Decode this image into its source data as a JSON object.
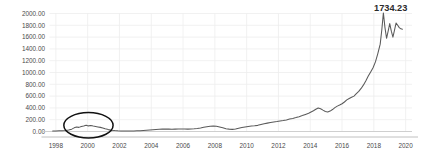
{
  "chart_data": {
    "type": "line",
    "title": "",
    "subtitle": "",
    "xlabel": "",
    "ylabel": "",
    "xlim": [
      1997.6,
      2020.4
    ],
    "ylim": [
      0,
      2000
    ],
    "grid": true,
    "legend": false,
    "legend_position": "none",
    "y_ticks": [
      0,
      200,
      400,
      600,
      800,
      1000,
      1200,
      1400,
      1600,
      1800,
      2000
    ],
    "y_tick_labels": [
      "0.00",
      "200.00",
      "400.00",
      "600.00",
      "800.00",
      "1000.00",
      "1200.00",
      "1400.00",
      "1600.00",
      "1800.00",
      "2000.00"
    ],
    "x_ticks": [
      1998,
      2000,
      2002,
      2004,
      2006,
      2008,
      2010,
      2012,
      2014,
      2016,
      2018,
      2020
    ],
    "x_tick_labels": [
      "1998",
      "2000",
      "2002",
      "2004",
      "2006",
      "2008",
      "2010",
      "2012",
      "2014",
      "2016",
      "2018",
      "2020"
    ],
    "series": [
      {
        "name": "price",
        "color": "#5a5a5a",
        "x": [
          1997.8,
          1998.0,
          1998.2,
          1998.4,
          1998.6,
          1998.8,
          1999.0,
          1999.15,
          1999.3,
          1999.45,
          1999.6,
          1999.75,
          1999.9,
          2000.05,
          2000.2,
          2000.35,
          2000.5,
          2000.65,
          2000.8,
          2000.95,
          2001.1,
          2001.3,
          2001.5,
          2001.7,
          2001.9,
          2002.1,
          2002.3,
          2002.5,
          2002.7,
          2002.9,
          2003.1,
          2003.3,
          2003.5,
          2003.7,
          2003.9,
          2004.1,
          2004.3,
          2004.5,
          2004.7,
          2004.9,
          2005.1,
          2005.3,
          2005.5,
          2005.7,
          2005.9,
          2006.1,
          2006.3,
          2006.5,
          2006.7,
          2006.9,
          2007.1,
          2007.3,
          2007.5,
          2007.7,
          2007.9,
          2008.1,
          2008.3,
          2008.5,
          2008.7,
          2008.9,
          2009.1,
          2009.3,
          2009.5,
          2009.7,
          2009.9,
          2010.1,
          2010.3,
          2010.5,
          2010.7,
          2010.9,
          2011.1,
          2011.3,
          2011.5,
          2011.7,
          2011.9,
          2012.1,
          2012.3,
          2012.5,
          2012.7,
          2012.9,
          2013.1,
          2013.3,
          2013.5,
          2013.7,
          2013.9,
          2014.05,
          2014.2,
          2014.35,
          2014.5,
          2014.65,
          2014.8,
          2014.95,
          2015.1,
          2015.25,
          2015.4,
          2015.55,
          2015.7,
          2015.85,
          2016.0,
          2016.15,
          2016.3,
          2016.45,
          2016.6,
          2016.75,
          2016.9,
          2017.05,
          2017.2,
          2017.35,
          2017.5,
          2017.65,
          2017.8,
          2017.95,
          2018.1,
          2018.25,
          2018.4,
          2018.5,
          2018.6,
          2018.7,
          2018.8,
          2018.9,
          2019.0,
          2019.1,
          2019.2,
          2019.3,
          2019.4,
          2019.5,
          2019.6,
          2019.7,
          2019.8
        ],
        "y": [
          8,
          10,
          12,
          14,
          18,
          26,
          40,
          62,
          75,
          70,
          85,
          95,
          108,
          95,
          100,
          92,
          85,
          78,
          70,
          60,
          45,
          32,
          22,
          16,
          12,
          10,
          9,
          8,
          8,
          9,
          11,
          14,
          18,
          22,
          26,
          30,
          34,
          38,
          40,
          42,
          40,
          38,
          40,
          42,
          44,
          42,
          40,
          42,
          46,
          52,
          60,
          72,
          82,
          90,
          94,
          88,
          76,
          62,
          48,
          40,
          36,
          42,
          55,
          68,
          78,
          86,
          92,
          96,
          104,
          118,
          130,
          142,
          152,
          160,
          168,
          178,
          186,
          196,
          210,
          222,
          236,
          252,
          270,
          290,
          308,
          330,
          352,
          376,
          398,
          386,
          362,
          340,
          330,
          346,
          372,
          404,
          430,
          448,
          470,
          500,
          536,
          560,
          580,
          600,
          640,
          680,
          730,
          790,
          860,
          940,
          1010,
          1080,
          1180,
          1320,
          1480,
          1720,
          2010,
          1760,
          1580,
          1700,
          1830,
          1700,
          1600,
          1720,
          1840,
          1800,
          1760,
          1740,
          1734.23
        ]
      }
    ],
    "annotations": [
      {
        "name": "last-value-label",
        "text": "1734.23",
        "x": 2019.9,
        "y": 1734.23
      },
      {
        "name": "dotcom-bubble-highlight",
        "type": "ellipse",
        "center_x": 2000.05,
        "center_y": 105,
        "radius_x": 1.55,
        "radius_y": 215
      }
    ],
    "colors": {
      "line": "#5a5a5a",
      "grid": "#ededed",
      "axis": "#b9b9b9",
      "tick_label": "#4a4a4a",
      "annotation_text": "#2b2b2b",
      "highlight_stroke": "#111111",
      "background": "#ffffff"
    }
  }
}
